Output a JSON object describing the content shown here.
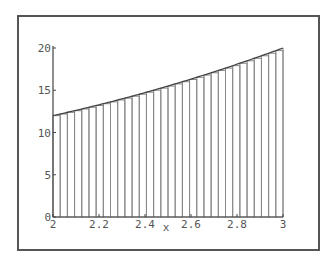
{
  "chart_data": {
    "type": "bar",
    "subtype": "riemann-sum-rectangles",
    "title": "",
    "xlabel": "x",
    "ylabel": "",
    "xlim": [
      2,
      3
    ],
    "ylim": [
      0,
      20
    ],
    "x_ticks": [
      "2",
      "2.2",
      "2.4",
      "2.6",
      "2.8",
      "3"
    ],
    "y_ticks": [
      "0",
      "5",
      "10",
      "15",
      "20"
    ],
    "grid": false,
    "legend": null,
    "n_rectangles": 32,
    "function_estimate": "2x^2 - 2x + 8",
    "sample_points": [
      {
        "x": 2.0,
        "y": 12.0
      },
      {
        "x": 2.5,
        "y": 15.5
      },
      {
        "x": 2.8,
        "y": 18.1
      },
      {
        "x": 3.0,
        "y": 20.0
      }
    ]
  },
  "colors": {
    "frame": "#555555",
    "axis": "#444444",
    "bars": "#888888",
    "curve": "#444444",
    "labels": "#555555"
  }
}
